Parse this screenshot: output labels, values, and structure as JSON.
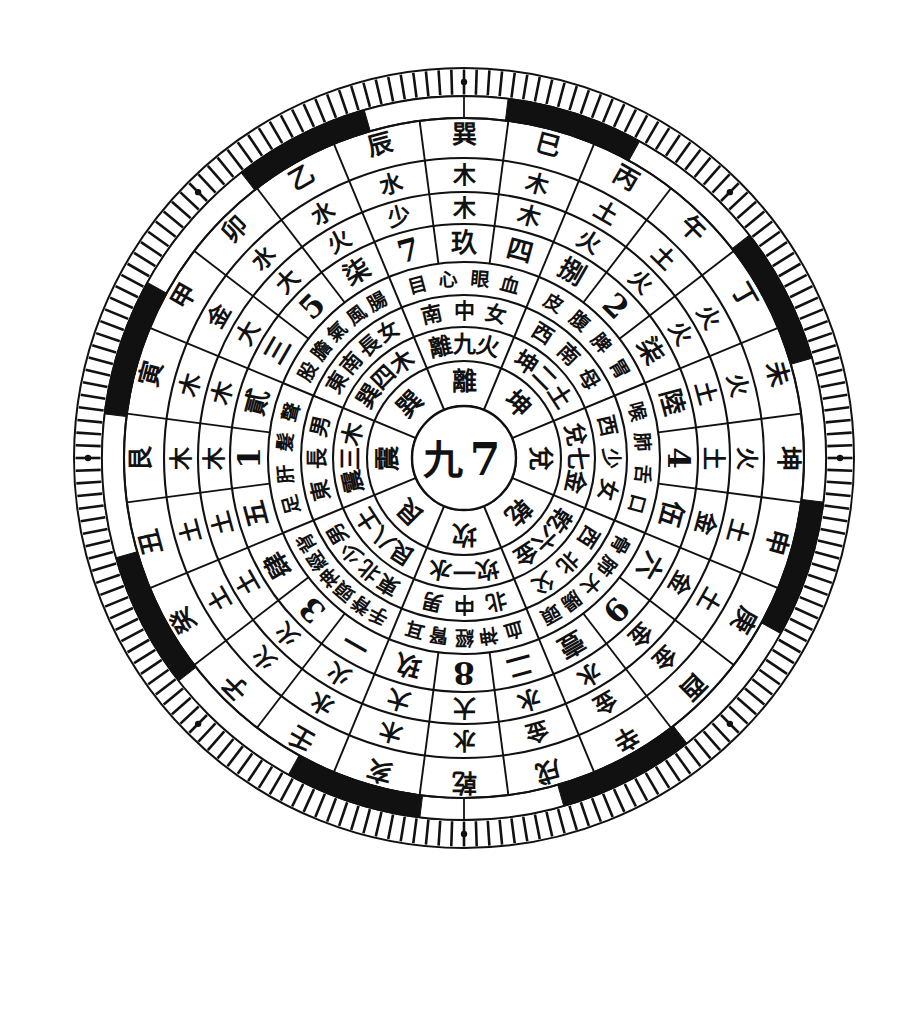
{
  "figure": {
    "kind": "feng-shui-luopan-compass-wheel",
    "background": "#ffffff",
    "ink": "#111111",
    "center": {
      "cx": 464,
      "cy": 458
    },
    "outer_radius": 390
  },
  "center_disc": {
    "name": "center-disc",
    "labels": [
      "九",
      "7"
    ]
  },
  "ring_trigram_inner": {
    "name": "inner-eight-sector-ring",
    "note": "innermost 8-sector ring, single glyph per sector",
    "sectors": [
      {
        "dir": "N",
        "label": "坎"
      },
      {
        "dir": "NE",
        "label": "艮"
      },
      {
        "dir": "E",
        "label": "震"
      },
      {
        "dir": "SE",
        "label": "巽"
      },
      {
        "dir": "S",
        "label": "離"
      },
      {
        "dir": "SW",
        "label": "坤"
      },
      {
        "dir": "W",
        "label": "兌"
      },
      {
        "dir": "NW",
        "label": "乾"
      }
    ]
  },
  "ring_trigram_number_element": {
    "name": "trigram-number-element-ring",
    "note": "8 sectors: trigram + luoshu number + five-element",
    "sectors": [
      {
        "dir": "N",
        "text": "坎一水"
      },
      {
        "dir": "NE",
        "text": "艮八土"
      },
      {
        "dir": "E",
        "text": "震三木"
      },
      {
        "dir": "SE",
        "text": "巽四木"
      },
      {
        "dir": "S",
        "text": "離九火"
      },
      {
        "dir": "SW",
        "text": "坤二土"
      },
      {
        "dir": "W",
        "text": "兌七金"
      },
      {
        "dir": "NW",
        "text": "乾六金"
      }
    ]
  },
  "ring_direction_family": {
    "name": "direction-family-ring",
    "note": "8 sectors: compass direction + family-member attribution",
    "sectors": [
      {
        "dir": "N",
        "text": "北中男"
      },
      {
        "dir": "NE",
        "text": "東北少男"
      },
      {
        "dir": "E",
        "text": "東長男"
      },
      {
        "dir": "SE",
        "text": "東南長女"
      },
      {
        "dir": "S",
        "text": "南中女"
      },
      {
        "dir": "SW",
        "text": "西南母"
      },
      {
        "dir": "W",
        "text": "西少女"
      },
      {
        "dir": "NW",
        "text": "西北父"
      }
    ]
  },
  "ring_body_parts": {
    "name": "body-parts-ring",
    "note": "8 sectors: associated organs / body parts",
    "sectors": [
      {
        "dir": "N",
        "text": "血神經腎耳"
      },
      {
        "dir": "NE",
        "text": "手脊頭神經背"
      },
      {
        "dir": "E",
        "text": "足肝髮聲"
      },
      {
        "dir": "SE",
        "text": "股膽氣風腸"
      },
      {
        "dir": "S",
        "text": "目心眼血"
      },
      {
        "dir": "SW",
        "text": "皮腹脾胃"
      },
      {
        "dir": "W",
        "text": "喉肺舌口"
      },
      {
        "dir": "NW",
        "text": "骨肺大腸頭"
      }
    ]
  },
  "ring_numbers": {
    "name": "numerals-ring",
    "note": "24 cells; mixture of Chinese numerals and bold Arabic numerals",
    "cells": [
      {
        "idx": 0,
        "dir_deg": 0,
        "label": "玖",
        "style": "han"
      },
      {
        "idx": 1,
        "dir_deg": 15,
        "label": "四",
        "style": "han"
      },
      {
        "idx": 2,
        "dir_deg": 30,
        "label": "捌",
        "style": "han"
      },
      {
        "idx": 3,
        "dir_deg": 45,
        "label": "2",
        "style": "arab"
      },
      {
        "idx": 4,
        "dir_deg": 60,
        "label": "柒",
        "style": "han"
      },
      {
        "idx": 5,
        "dir_deg": 75,
        "label": "陸",
        "style": "han"
      },
      {
        "idx": 6,
        "dir_deg": 90,
        "label": "4",
        "style": "arab"
      },
      {
        "idx": 7,
        "dir_deg": 105,
        "label": "伍",
        "style": "han"
      },
      {
        "idx": 8,
        "dir_deg": 120,
        "label": "六",
        "style": "han"
      },
      {
        "idx": 9,
        "dir_deg": 135,
        "label": "9",
        "style": "arab"
      },
      {
        "idx": 10,
        "dir_deg": 150,
        "label": "壹",
        "style": "han"
      },
      {
        "idx": 11,
        "dir_deg": 165,
        "label": "二",
        "style": "han"
      },
      {
        "idx": 12,
        "dir_deg": 180,
        "label": "8",
        "style": "arab"
      },
      {
        "idx": 13,
        "dir_deg": 195,
        "label": "玖",
        "style": "han"
      },
      {
        "idx": 14,
        "dir_deg": 210,
        "label": "一",
        "style": "han"
      },
      {
        "idx": 15,
        "dir_deg": 225,
        "label": "3",
        "style": "arab"
      },
      {
        "idx": 16,
        "dir_deg": 240,
        "label": "肆",
        "style": "han"
      },
      {
        "idx": 17,
        "dir_deg": 255,
        "label": "五",
        "style": "han"
      },
      {
        "idx": 18,
        "dir_deg": 270,
        "label": "1",
        "style": "arab"
      },
      {
        "idx": 19,
        "dir_deg": 285,
        "label": "貳",
        "style": "han"
      },
      {
        "idx": 20,
        "dir_deg": 300,
        "label": "三",
        "style": "han"
      },
      {
        "idx": 21,
        "dir_deg": 315,
        "label": "5",
        "style": "arab"
      },
      {
        "idx": 22,
        "dir_deg": 330,
        "label": "柒",
        "style": "han"
      },
      {
        "idx": 23,
        "dir_deg": 345,
        "label": "7",
        "style": "arab"
      }
    ]
  },
  "ring_size_marks": {
    "name": "size-mark-ring",
    "note": "24 cells of 大 / 少 size markers",
    "cells": [
      "木",
      "木",
      "火",
      "火",
      "火",
      "土",
      "土",
      "金",
      "金",
      "金",
      "水",
      "水",
      "大",
      "大",
      "火",
      "火",
      "土",
      "土",
      "木",
      "木",
      "大",
      "大",
      "火",
      "少"
    ]
  },
  "ring_elements": {
    "name": "five-element-ring",
    "note": "24 cells, wuxing element of each mountain",
    "cells": [
      "木",
      "木",
      "土",
      "土",
      "火",
      "火",
      "火",
      "土",
      "土",
      "金",
      "金",
      "金",
      "水",
      "木",
      "水",
      "火",
      "土",
      "土",
      "木",
      "木",
      "金",
      "水",
      "水",
      "水"
    ]
  },
  "ring_24_mountains": {
    "name": "twenty-four-mountains-ring",
    "note": "outermost character ring: 24 mountains (earthly branches, heavenly stems, trigrams)",
    "cells": [
      {
        "idx": 0,
        "label": "乾",
        "deg": 180
      },
      {
        "idx": 1,
        "label": "亥",
        "deg": 195
      },
      {
        "idx": 2,
        "label": "壬",
        "deg": 210
      },
      {
        "idx": 3,
        "label": "子",
        "deg": 225
      },
      {
        "idx": 4,
        "label": "癸",
        "deg": 240
      },
      {
        "idx": 5,
        "label": "丑",
        "deg": 255
      },
      {
        "idx": 6,
        "label": "艮",
        "deg": 270
      },
      {
        "idx": 7,
        "label": "寅",
        "deg": 285
      },
      {
        "idx": 8,
        "label": "甲",
        "deg": 300
      },
      {
        "idx": 9,
        "label": "卯",
        "deg": 315
      },
      {
        "idx": 10,
        "label": "乙",
        "deg": 330
      },
      {
        "idx": 11,
        "label": "辰",
        "deg": 345
      },
      {
        "idx": 12,
        "label": "巽",
        "deg": 0
      },
      {
        "idx": 13,
        "label": "巳",
        "deg": 15
      },
      {
        "idx": 14,
        "label": "丙",
        "deg": 30
      },
      {
        "idx": 15,
        "label": "午",
        "deg": 45
      },
      {
        "idx": 16,
        "label": "丁",
        "deg": 60
      },
      {
        "idx": 17,
        "label": "未",
        "deg": 75
      },
      {
        "idx": 18,
        "label": "坤",
        "deg": 90
      },
      {
        "idx": 19,
        "label": "申",
        "deg": 105
      },
      {
        "idx": 20,
        "label": "庚",
        "deg": 120
      },
      {
        "idx": 21,
        "label": "酉",
        "deg": 135
      },
      {
        "idx": 22,
        "label": "辛",
        "deg": 150
      },
      {
        "idx": 23,
        "label": "戌",
        "deg": 165
      }
    ]
  },
  "ring_black_band": {
    "name": "black-white-arc-band",
    "note": "alternating solid black and blank arc segments, 8 black arcs",
    "black_segment_count": 8,
    "segment_span_deg": 22,
    "start_offsets_deg": [
      7,
      52,
      97,
      142,
      187,
      232,
      277,
      322
    ]
  },
  "ring_ticks": {
    "name": "degree-tick-ring",
    "note": "fine radial tick marks around the outer edge",
    "tick_count": 192,
    "dot_marker_count": 8
  }
}
